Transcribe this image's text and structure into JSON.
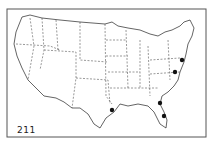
{
  "figure": {
    "label": "211",
    "frame": {
      "x": 7,
      "y": 9,
      "width": 199,
      "height": 128
    },
    "points": [
      {
        "x": 182,
        "y": 60
      },
      {
        "x": 175,
        "y": 72
      },
      {
        "x": 112,
        "y": 110
      },
      {
        "x": 160,
        "y": 103
      },
      {
        "x": 164,
        "y": 116
      }
    ],
    "colors": {
      "ink": "#1a1a1a",
      "background": "#ffffff",
      "frame": "#555555"
    }
  }
}
